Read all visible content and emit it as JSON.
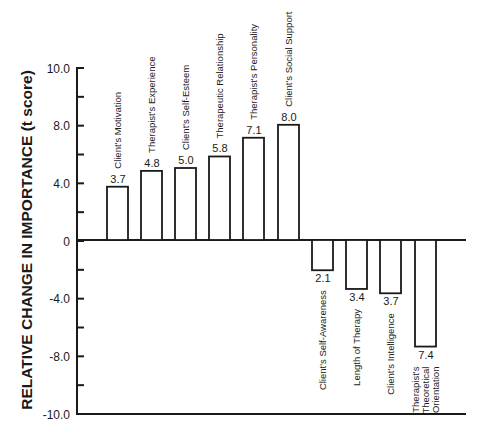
{
  "chart_data": {
    "type": "bar",
    "title": "",
    "xlabel": "",
    "ylabel": "RELATIVE CHANGE IN IMPORTANCE (t score)",
    "ylim": [
      -10.0,
      10.0
    ],
    "y_tick_labels": [
      "10.0",
      "8.0",
      "4.0",
      "0",
      "-4.0",
      "-8.0",
      "-10.0"
    ],
    "grid": false,
    "legend": null,
    "categories": [
      "Client's Motivation",
      "Therapist's Experience",
      "Client's Self-Esteem",
      "Therapeutic Relationship",
      "Therapist's Personality",
      "Client's Social Support",
      "Client's Self-Awareness",
      "Length of Therapy",
      "Client's Intelligence",
      "Therapist's Theoretical Orientation"
    ],
    "values": [
      3.7,
      4.8,
      5.0,
      5.8,
      7.1,
      8.0,
      -2.1,
      -3.4,
      -3.7,
      -7.4
    ],
    "value_labels": [
      "3.7",
      "4.8",
      "5.0",
      "5.8",
      "7.1",
      "8.0",
      "2.1",
      "3.4",
      "3.7",
      "7.4"
    ]
  }
}
